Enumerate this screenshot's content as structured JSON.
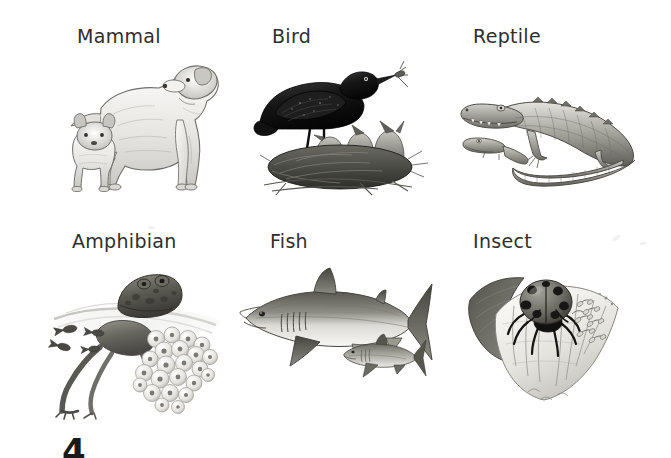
{
  "page": {
    "background_color": "#ffffff",
    "text_color": "#2e2e2e",
    "columns": 3,
    "rows": 2
  },
  "cells": [
    {
      "id": "mammal",
      "label": "Mammal",
      "label_x": 77,
      "label_y": 27,
      "art_name": "dog-with-puppy-illustration",
      "art_description": "Adult golden retriever dog standing, with a puppy beside it",
      "art_x": 55,
      "art_y": 48,
      "art_w": 175,
      "art_h": 148
    },
    {
      "id": "bird",
      "label": "Bird",
      "label_x": 272,
      "label_y": 27,
      "art_name": "blackbird-nest-illustration",
      "art_description": "Adult blackbird holding an insect, standing over a nest of three open-beaked chicks",
      "art_x": 252,
      "art_y": 45,
      "art_w": 180,
      "art_h": 152
    },
    {
      "id": "reptile",
      "label": "Reptile",
      "label_x": 473,
      "label_y": 27,
      "art_name": "crocodile-with-hatchling-illustration",
      "art_description": "Adult crocodile lying with a small hatchling crocodile in front of it",
      "art_x": 455,
      "art_y": 82,
      "art_w": 200,
      "art_h": 112
    },
    {
      "id": "amphibian",
      "label": "Amphibian",
      "label_x": 72,
      "label_y": 232,
      "art_name": "frog-with-spawn-illustration",
      "art_description": "Frog at the water surface with a mass of frogspawn and swimming tadpoles",
      "art_x": 52,
      "art_y": 255,
      "art_w": 180,
      "art_h": 165
    },
    {
      "id": "fish",
      "label": "Fish",
      "label_x": 270,
      "label_y": 232,
      "art_name": "shark-with-young-illustration",
      "art_description": "Large shark with a much smaller young shark swimming below it",
      "art_x": 236,
      "art_y": 266,
      "art_w": 200,
      "art_h": 112
    },
    {
      "id": "insect",
      "label": "Insect",
      "label_x": 473,
      "label_y": 232,
      "art_name": "ladybird-on-leaf-illustration",
      "art_description": "Ladybird on a pale leaf with a cluster of eggs and tiny larvae beside it",
      "art_x": 466,
      "art_y": 262,
      "art_w": 160,
      "art_h": 150
    }
  ],
  "footer": {
    "cut_glyph": "4",
    "cut_glyph_x": 62,
    "cut_glyph_y": 434,
    "note": "Partially visible page number cropped at the bottom edge"
  }
}
